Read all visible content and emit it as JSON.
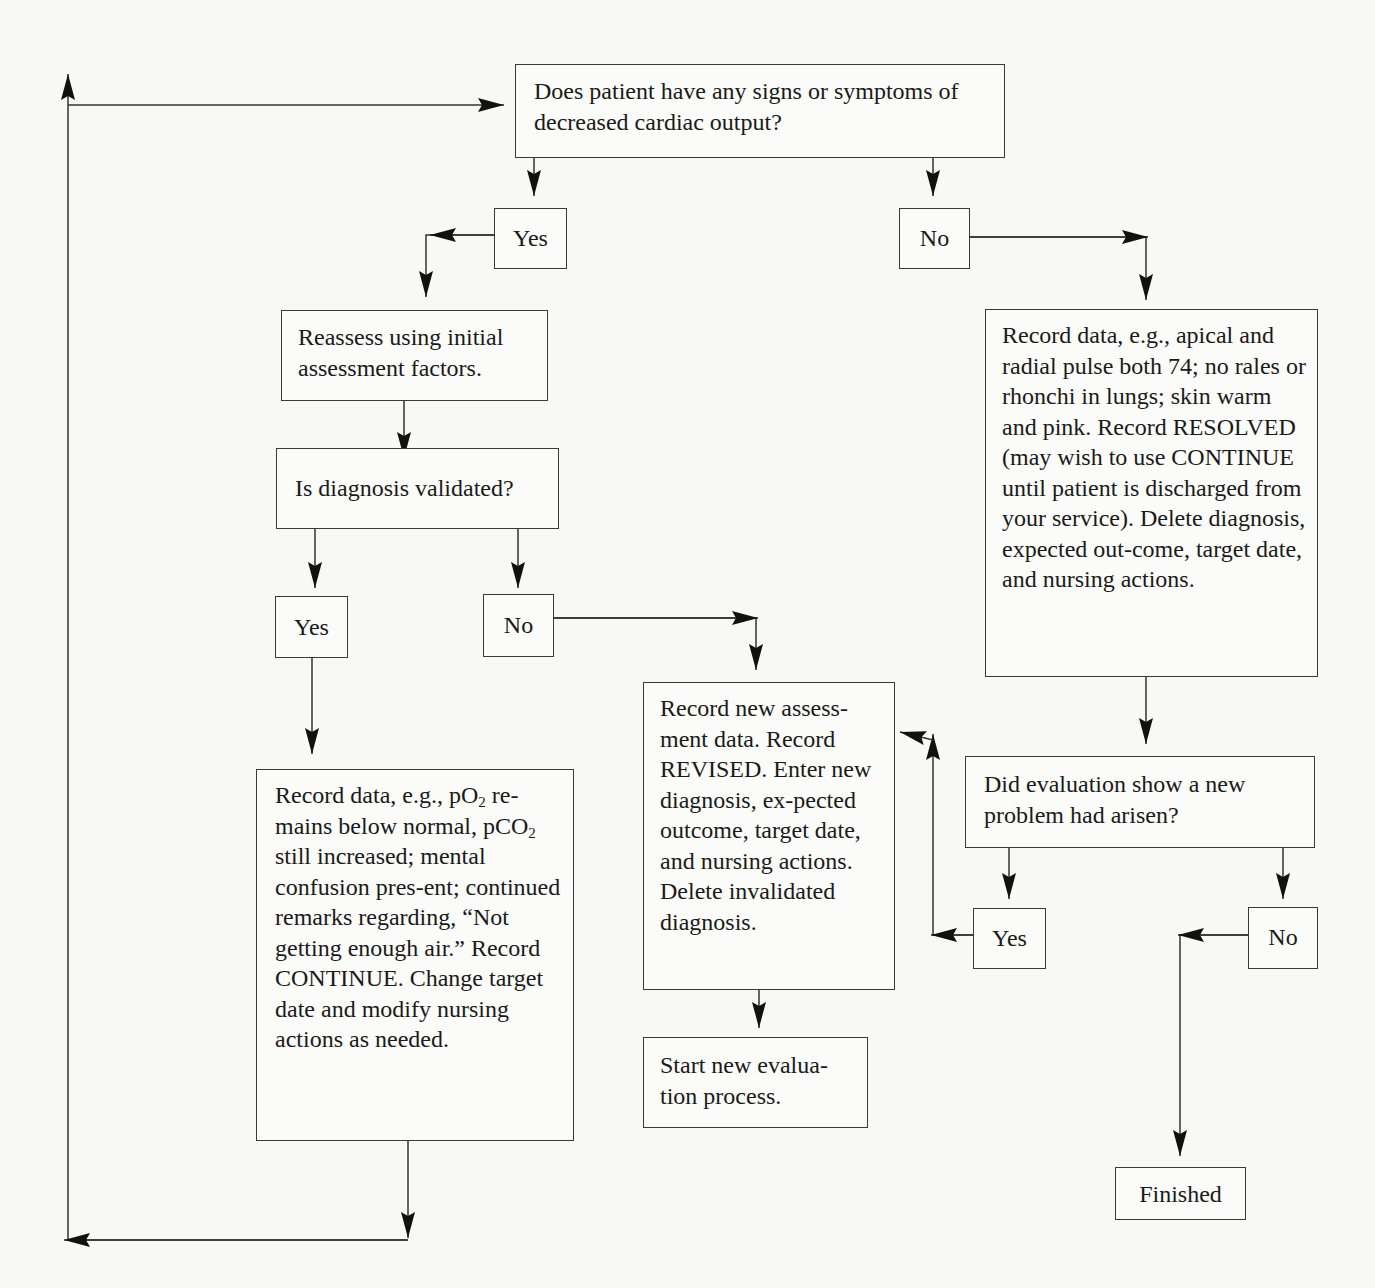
{
  "nodes": {
    "q_cardiac": "Does patient have any signs or symptoms of decreased cardiac output?",
    "yes_1": "Yes",
    "no_1": "No",
    "reassess": "Reassess using initial assessment factors.",
    "q_validated": "Is diagnosis validated?",
    "yes_2": "Yes",
    "no_2": "No",
    "record_continue": {
      "part1": "Record data, e.g., pO",
      "sub1": "2",
      "part2": " re-mains below normal, pCO",
      "sub2": "2",
      "part3": " still increased; mental confusion pres-ent; continued remarks regarding, “Not getting enough air.” Record CONTINUE. Change target date and modify nursing actions as needed."
    },
    "record_revised": "Record new assess-ment data. Record REVISED. Enter new diagnosis, ex-pected outcome, target date, and nursing actions. Delete invalidated diagnosis.",
    "start_new": "Start new evalua-tion process.",
    "record_resolved": "Record data, e.g., apical and radial pulse both 74; no rales or rhonchi in lungs; skin warm and pink. Record RESOLVED (may wish to use CONTINUE until patient is discharged from your service). Delete diagnosis, expected out-come, target date, and nursing actions.",
    "q_new_problem": "Did evaluation show a new problem had arisen?",
    "yes_3": "Yes",
    "no_3": "No",
    "finished": "Finished"
  }
}
